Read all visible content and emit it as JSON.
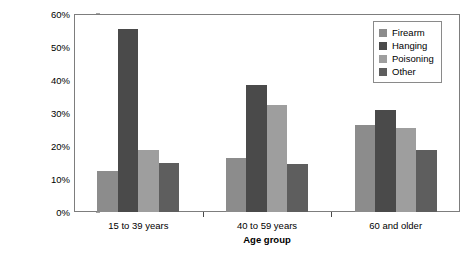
{
  "chart_data": {
    "type": "bar",
    "title": "",
    "subtitle": "",
    "xlabel": "Age group",
    "ylabel": "Percentage of total suicides",
    "categories": [
      "15 to 39 years",
      "40 to 59 years",
      "60 and older"
    ],
    "series": [
      {
        "name": "Firearm",
        "color": "#8c8c8c",
        "values": [
          12.5,
          16.3,
          26.5
        ]
      },
      {
        "name": "Hanging",
        "color": "#4a4a4a",
        "values": [
          55.4,
          38.6,
          31.0
        ]
      },
      {
        "name": "Poisoning",
        "color": "#9e9e9e",
        "values": [
          18.7,
          32.3,
          25.6
        ]
      },
      {
        "name": "Other",
        "color": "#5e5e5e",
        "values": [
          15.0,
          14.6,
          18.8
        ]
      }
    ],
    "ylim": [
      0,
      60
    ],
    "ytick_values": [
      0,
      10,
      20,
      30,
      40,
      50,
      60
    ],
    "ytick_labels": [
      "0%",
      "10%",
      "20%",
      "30%",
      "40%",
      "50%",
      "60%"
    ],
    "grid": false,
    "legend_position": "top-right",
    "legend_entries": [
      "Firearm",
      "Hanging",
      "Poisoning",
      "Other"
    ],
    "axis_color": "#7d7d7d",
    "background_color": "#ffffff"
  }
}
